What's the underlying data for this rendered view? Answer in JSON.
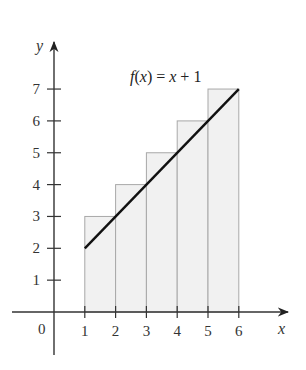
{
  "chart_data": {
    "type": "bar",
    "title": "",
    "xlabel": "x",
    "ylabel": "y",
    "origin_label": "0",
    "xlim": [
      0,
      7
    ],
    "ylim": [
      0,
      7.5
    ],
    "x_ticks": [
      "1",
      "2",
      "3",
      "4",
      "5",
      "6"
    ],
    "y_ticks": [
      "1",
      "2",
      "3",
      "4",
      "5",
      "6",
      "7"
    ],
    "rectangles": [
      {
        "x_left": 1,
        "x_right": 2,
        "height": 3
      },
      {
        "x_left": 2,
        "x_right": 3,
        "height": 4
      },
      {
        "x_left": 3,
        "x_right": 4,
        "height": 5
      },
      {
        "x_left": 4,
        "x_right": 5,
        "height": 6
      },
      {
        "x_left": 5,
        "x_right": 6,
        "height": 7
      }
    ],
    "categories": [
      "[1,2]",
      "[2,3]",
      "[3,4]",
      "[4,5]",
      "[5,6]"
    ],
    "values": [
      3,
      4,
      5,
      6,
      7
    ],
    "line": {
      "label": "f(x) = x + 1",
      "points": [
        [
          1,
          2
        ],
        [
          6,
          7
        ]
      ]
    },
    "annotations": [
      "f(x) = x + 1"
    ],
    "grid": false,
    "colors": {
      "fill": "#f1f1f1",
      "rect_stroke": "#a8a8a8",
      "axis": "#333333",
      "line": "#111111"
    }
  }
}
